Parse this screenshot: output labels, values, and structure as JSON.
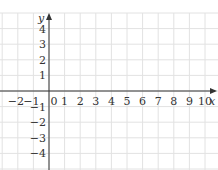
{
  "chart_data": {
    "type": "line",
    "title": "",
    "xlabel": "x",
    "ylabel": "y",
    "xlim": [
      -3,
      11
    ],
    "ylim": [
      -5,
      5
    ],
    "grid": true,
    "x_ticks": [
      "−2",
      "−1",
      "0",
      "1",
      "2",
      "3",
      "4",
      "5",
      "6",
      "7",
      "8",
      "9",
      "10"
    ],
    "y_ticks": [
      "4",
      "3",
      "2",
      "1",
      "−1",
      "−2",
      "−3",
      "−4"
    ],
    "series": [],
    "legend": null
  },
  "colors": {
    "grid": "#e2e2e2",
    "axis": "#333333",
    "background": "#ffffff"
  },
  "layout": {
    "origin_px": [
      49,
      91
    ],
    "unit_px": 15.6
  }
}
